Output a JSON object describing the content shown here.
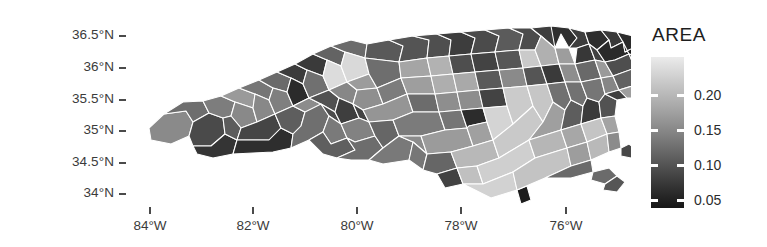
{
  "figure": {
    "kind": "choropleth-map",
    "region": "North Carolina counties"
  },
  "axes": {
    "y": {
      "ticks": [
        {
          "label": "36.5°N",
          "value": 36.5,
          "y": 36
        },
        {
          "label": "36°N",
          "value": 36.0,
          "y": 68
        },
        {
          "label": "35.5°N",
          "value": 35.5,
          "y": 100
        },
        {
          "label": "35°N",
          "value": 35.0,
          "y": 131
        },
        {
          "label": "34.5°N",
          "value": 34.5,
          "y": 163
        },
        {
          "label": "34°N",
          "value": 34.0,
          "y": 194
        }
      ]
    },
    "x": {
      "ticks": [
        {
          "label": "84°W",
          "value": -84,
          "x": 150
        },
        {
          "label": "82°W",
          "value": -82,
          "x": 253
        },
        {
          "label": "80°W",
          "value": -80,
          "x": 357
        },
        {
          "label": "78°W",
          "value": -78,
          "x": 461
        },
        {
          "label": "76°W",
          "value": -76,
          "x": 566
        }
      ]
    }
  },
  "legend": {
    "title": "AREA",
    "ticks": [
      {
        "label": "0.20",
        "value": 0.2,
        "y": 71
      },
      {
        "label": "0.15",
        "value": 0.15,
        "y": 106
      },
      {
        "label": "0.10",
        "value": 0.1,
        "y": 141
      },
      {
        "label": "0.05",
        "value": 0.05,
        "y": 176
      }
    ],
    "gradient": {
      "high_color": "#ebebeb",
      "low_color": "#161616",
      "orientation": "vertical",
      "high_at": "top"
    }
  },
  "chart_data": {
    "type": "map",
    "title": "",
    "xlabel": "",
    "ylabel": "",
    "variable": "AREA",
    "xlim": [
      -84.6,
      -75.3
    ],
    "ylim": [
      33.8,
      36.7
    ],
    "grid": false,
    "legend_position": "right",
    "colormap": "grayscale (light = high AREA, dark = low AREA)",
    "value_range": [
      0.042,
      0.241
    ],
    "tick_values": [
      0.05,
      0.1,
      0.15,
      0.2
    ],
    "n_regions": 100
  }
}
